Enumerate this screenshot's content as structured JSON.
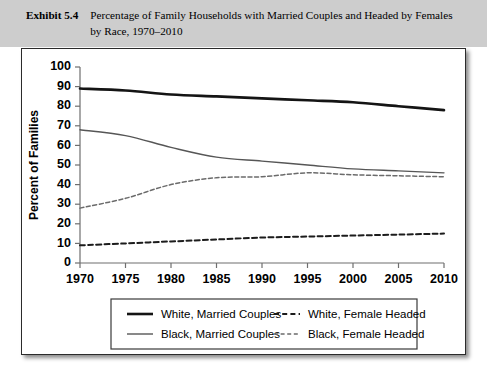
{
  "exhibit": {
    "label": "Exhibit 5.4",
    "title": "Percentage of Family Households with Married Couples and Headed by Females by Race, 1970–2010"
  },
  "colors": {
    "band_background": "#cdcdcd",
    "frame_border": "#2b2b2b",
    "white_married": "#141414",
    "black_married": "#565656",
    "white_female": "#1c1c1c",
    "black_female": "#6b6b6b",
    "axis": "#6e6e6e",
    "page_background": "#ffffff"
  },
  "chart_data": {
    "type": "line",
    "title": "Percentage of Family Households with Married Couples and Headed by Females by Race, 1970–2010",
    "xlabel": "",
    "ylabel": "Percent of Families",
    "x": [
      1970,
      1975,
      1980,
      1985,
      1990,
      1995,
      2000,
      2005,
      2010
    ],
    "xtick_labels": [
      "1970",
      "1975",
      "1980",
      "1985",
      "1990",
      "1995",
      "2000",
      "2005",
      "2010"
    ],
    "ytick_labels": [
      "0",
      "10",
      "20",
      "30",
      "40",
      "50",
      "60",
      "70",
      "80",
      "90",
      "100"
    ],
    "ytick_values": [
      0,
      10,
      20,
      30,
      40,
      50,
      60,
      70,
      80,
      90,
      100
    ],
    "xlim": [
      1970,
      2010
    ],
    "ylim": [
      0,
      100
    ],
    "grid": false,
    "legend_position": "below-center",
    "series": [
      {
        "name": "White, Married Couples",
        "style": "solid",
        "weight": "thick",
        "color": "#141414",
        "values": [
          89,
          88,
          86,
          85,
          84,
          83,
          82,
          80,
          78
        ]
      },
      {
        "name": "Black, Married Couples",
        "style": "solid",
        "weight": "thin",
        "color": "#565656",
        "values": [
          68,
          65,
          59,
          54,
          52,
          50,
          48,
          47,
          46
        ]
      },
      {
        "name": "White, Female Headed",
        "style": "dashed",
        "weight": "thick",
        "color": "#1c1c1c",
        "values": [
          9,
          10,
          11,
          12,
          13,
          13.5,
          14,
          14.5,
          15
        ]
      },
      {
        "name": "Black, Female Headed",
        "style": "dashed",
        "weight": "thin",
        "color": "#6b6b6b",
        "values": [
          28,
          33,
          40,
          43.5,
          44,
          46,
          45,
          44.5,
          44
        ]
      }
    ]
  },
  "legend": {
    "entries": [
      {
        "label": "White, Married Couples",
        "style": "solid",
        "weight": "thick"
      },
      {
        "label": "White, Female Headed",
        "style": "dashed",
        "weight": "thick"
      },
      {
        "label": "Black, Married Couples",
        "style": "solid",
        "weight": "thin"
      },
      {
        "label": "Black, Female Headed",
        "style": "dashed",
        "weight": "thin"
      }
    ]
  }
}
